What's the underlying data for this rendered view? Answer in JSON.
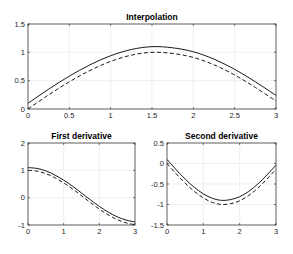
{
  "figure": {
    "background": "#ffffff",
    "line_color": "#000000",
    "grid_color": "#e6e6e6"
  },
  "chart_data": [
    {
      "type": "line",
      "title": "Interpolation",
      "xlabel": "",
      "ylabel": "",
      "xlim": [
        0,
        3
      ],
      "ylim": [
        0,
        1.5
      ],
      "xticks": [
        "0",
        "0.5",
        "1",
        "1.5",
        "2",
        "2.5",
        "3"
      ],
      "xtick_values": [
        0,
        0.5,
        1,
        1.5,
        2,
        2.5,
        3
      ],
      "yticks": [
        "0",
        "0.5",
        "1",
        "1.5"
      ],
      "ytick_values": [
        0,
        0.5,
        1,
        1.5
      ],
      "grid": true,
      "x": [
        0,
        0.25,
        0.5,
        0.75,
        1,
        1.25,
        1.5,
        1.75,
        2,
        2.25,
        2.5,
        2.75,
        3
      ],
      "series": [
        {
          "name": "interpolant",
          "style": "solid",
          "values": [
            0.1,
            0.35,
            0.58,
            0.78,
            0.94,
            1.05,
            1.1,
            1.08,
            1.01,
            0.88,
            0.7,
            0.48,
            0.24
          ]
        },
        {
          "name": "exact",
          "style": "dashed",
          "values": [
            0.0,
            0.25,
            0.48,
            0.68,
            0.84,
            0.95,
            1.0,
            0.98,
            0.91,
            0.78,
            0.6,
            0.38,
            0.14
          ]
        }
      ]
    },
    {
      "type": "line",
      "title": "First derivative",
      "xlabel": "",
      "ylabel": "",
      "xlim": [
        0,
        3
      ],
      "ylim": [
        -1,
        2
      ],
      "xticks": [
        "0",
        "1",
        "2",
        "3"
      ],
      "xtick_values": [
        0,
        1,
        2,
        3
      ],
      "yticks": [
        "-1",
        "0",
        "1",
        "2"
      ],
      "ytick_values": [
        -1,
        0,
        1,
        2
      ],
      "grid": true,
      "x": [
        0,
        0.25,
        0.5,
        0.75,
        1,
        1.25,
        1.5,
        1.75,
        2,
        2.25,
        2.5,
        2.75,
        3
      ],
      "series": [
        {
          "name": "interpolant",
          "style": "solid",
          "values": [
            1.1,
            1.07,
            0.98,
            0.83,
            0.64,
            0.42,
            0.17,
            -0.08,
            -0.32,
            -0.53,
            -0.7,
            -0.82,
            -0.89
          ]
        },
        {
          "name": "exact",
          "style": "dashed",
          "values": [
            1.0,
            0.97,
            0.88,
            0.73,
            0.54,
            0.32,
            0.07,
            -0.18,
            -0.42,
            -0.63,
            -0.8,
            -0.92,
            -0.99
          ]
        }
      ]
    },
    {
      "type": "line",
      "title": "Second derivative",
      "xlabel": "",
      "ylabel": "",
      "xlim": [
        0,
        3
      ],
      "ylim": [
        -1.5,
        0.5
      ],
      "xticks": [
        "0",
        "1",
        "2",
        "3"
      ],
      "xtick_values": [
        0,
        1,
        2,
        3
      ],
      "yticks": [
        "-1.5",
        "-1",
        "-0.5",
        "0",
        "0.5"
      ],
      "ytick_values": [
        -1.5,
        -1,
        -0.5,
        0,
        0.5
      ],
      "grid": true,
      "x": [
        0,
        0.25,
        0.5,
        0.75,
        1,
        1.25,
        1.5,
        1.75,
        2,
        2.25,
        2.5,
        2.75,
        3
      ],
      "series": [
        {
          "name": "interpolant",
          "style": "solid",
          "values": [
            0.1,
            -0.15,
            -0.38,
            -0.58,
            -0.74,
            -0.85,
            -0.9,
            -0.88,
            -0.81,
            -0.68,
            -0.5,
            -0.28,
            -0.04
          ]
        },
        {
          "name": "exact",
          "style": "dashed",
          "values": [
            0.0,
            -0.25,
            -0.48,
            -0.68,
            -0.84,
            -0.95,
            -1.0,
            -0.98,
            -0.91,
            -0.78,
            -0.6,
            -0.38,
            -0.14
          ]
        }
      ]
    }
  ]
}
